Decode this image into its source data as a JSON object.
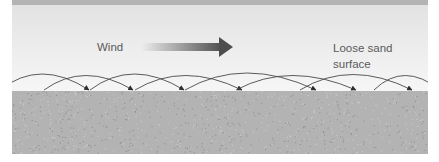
{
  "diagram": {
    "wind_label": "Wind",
    "surface_label_line1": "Loose sand",
    "surface_label_line2": "surface",
    "colors": {
      "top_bar": "#b4b4b4",
      "sky_top": "#e2e2e2",
      "sky_bottom": "#f6f6f6",
      "ground": "#b3b3b3",
      "ground_speckle": "#8a8a8a",
      "arc_stroke": "#4a4a4a",
      "wind_arrow_start": "#eaeaea",
      "wind_arrow_end": "#4e4e4e",
      "label_text": "#5a5a5a"
    },
    "trajectories": [
      {
        "from_x": 0,
        "to_x": 89,
        "peak_y": 76
      },
      {
        "from_x": 44,
        "to_x": 133,
        "peak_y": 79
      },
      {
        "from_x": 90,
        "to_x": 184,
        "peak_y": 76
      },
      {
        "from_x": 135,
        "to_x": 242,
        "peak_y": 79
      },
      {
        "from_x": 185,
        "to_x": 316,
        "peak_y": 74
      },
      {
        "from_x": 236,
        "to_x": 356,
        "peak_y": 79
      },
      {
        "from_x": 300,
        "to_x": 412,
        "peak_y": 77
      },
      {
        "from_x": 374,
        "to_x": 440,
        "peak_y": 79
      }
    ]
  }
}
